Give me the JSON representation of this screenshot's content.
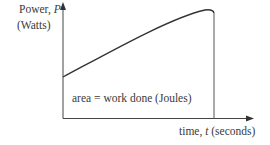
{
  "diagram": {
    "y_axis_label_line1": "Power, ",
    "y_axis_label_symbol": "P",
    "y_axis_label_line2": "(Watts)",
    "x_axis_label_prefix": "time, ",
    "x_axis_label_symbol": "t",
    "x_axis_label_suffix": " (seconds)",
    "area_label": "area = work done (Joules)",
    "colors": {
      "line": "#333333",
      "text": "#3a3a3a",
      "background": "#ffffff"
    }
  }
}
